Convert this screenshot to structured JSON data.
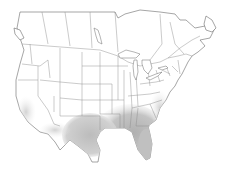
{
  "map": {
    "region": "North America (Canada and contiguous United States)",
    "style": "outline base map with state and province borders",
    "colors": {
      "background": "#ffffff",
      "land": "#ffffff",
      "border": "#6a6a6a",
      "range_dark": "#b4b4b4",
      "range_light": "#e6e6e6"
    },
    "highlighted_range": {
      "description": "shaded range across the southern and southeastern United States",
      "core_areas": [
        "Texas",
        "Louisiana",
        "Mississippi",
        "Alabama",
        "Georgia",
        "Florida",
        "South Carolina",
        "North Carolina coast"
      ],
      "peripheral_areas": [
        "Oklahoma",
        "Arkansas",
        "Tennessee",
        "Virginia coast",
        "southern California coast",
        "southern Arizona / New Mexico"
      ]
    }
  }
}
